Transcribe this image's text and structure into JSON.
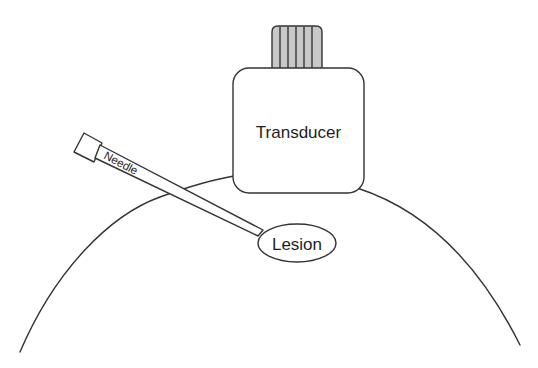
{
  "diagram": {
    "type": "ultrasound-guided needle biopsy schematic",
    "labels": {
      "transducer": "Transducer",
      "needle": "Needle",
      "lesion": "Lesion"
    },
    "components": [
      {
        "id": "body-contour",
        "description": "large arc representing body surface"
      },
      {
        "id": "transducer",
        "description": "rounded-square probe with striped connector on top"
      },
      {
        "id": "needle",
        "description": "angled needle with square hub entering body toward lesion"
      },
      {
        "id": "lesion",
        "description": "ellipse target beneath transducer"
      }
    ],
    "colors": {
      "stroke": "#333333",
      "connector_fill": "#c8c8c8",
      "text": "#1e1e1e",
      "background": "#ffffff"
    }
  }
}
